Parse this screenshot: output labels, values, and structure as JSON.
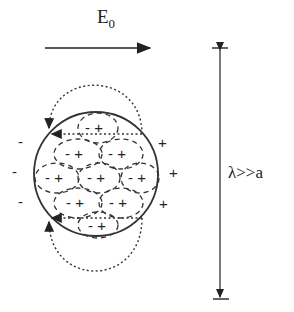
{
  "field_label": {
    "main": "E",
    "subscript": "0"
  },
  "wavelength_label": "λ>>a",
  "outside_charges": {
    "left": [
      "-",
      "-",
      "-"
    ],
    "right": [
      "+",
      "+",
      "+"
    ]
  },
  "inner_dipoles": [
    {
      "label": "- +",
      "row": 1
    },
    {
      "label": "- +",
      "row": 2
    },
    {
      "label": "- +",
      "row": 2
    },
    {
      "label": "- +",
      "row": 3
    },
    {
      "label": "- +",
      "row": 3
    },
    {
      "label": "- +",
      "row": 3
    },
    {
      "label": "- +",
      "row": 4
    },
    {
      "label": "- +",
      "row": 4
    },
    {
      "label": "- +",
      "row": 5
    }
  ],
  "colors": {
    "ink": "#222222",
    "background": "#ffffff"
  }
}
